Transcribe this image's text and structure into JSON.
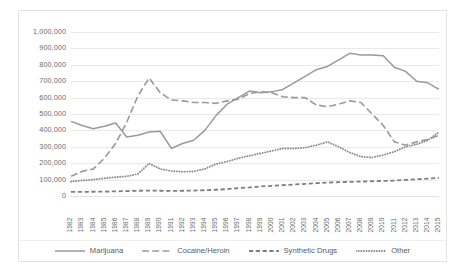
{
  "chart_data": {
    "type": "line",
    "title": "",
    "xlabel": "",
    "ylabel": "",
    "grid": true,
    "legend_position": "bottom",
    "ylim": [
      0,
      1000000
    ],
    "ytick_labels": [
      "1,000,000",
      "900,000",
      "800,000",
      "700,000",
      "600,000",
      "500,000",
      "400,000",
      "300,000",
      "200,000",
      "100,000",
      "0"
    ],
    "yticks": [
      1000000,
      900000,
      800000,
      700000,
      600000,
      500000,
      400000,
      300000,
      200000,
      100000,
      0
    ],
    "categories": [
      "1982",
      "1983",
      "1984",
      "1985",
      "1986",
      "1987",
      "1988",
      "1989",
      "1990",
      "1991",
      "1992",
      "1993",
      "1994",
      "1995",
      "1996",
      "1997",
      "1998",
      "1999",
      "2000",
      "2001",
      "2002",
      "2003",
      "2004",
      "2005",
      "2006",
      "2007",
      "2008",
      "2009",
      "2010",
      "2011",
      "2012",
      "2013",
      "2014",
      "2015"
    ],
    "series": [
      {
        "name": "Marijuana",
        "style": "solid",
        "color": "#9a9a9c",
        "values": [
          455000,
          430000,
          410000,
          425000,
          445000,
          360000,
          370000,
          390000,
          395000,
          290000,
          320000,
          340000,
          400000,
          490000,
          560000,
          600000,
          640000,
          630000,
          635000,
          650000,
          690000,
          730000,
          770000,
          790000,
          830000,
          870000,
          860000,
          860000,
          855000,
          785000,
          760000,
          700000,
          690000,
          650000
        ]
      },
      {
        "name": "Cocaine/Heroin",
        "style": "long-dash",
        "color": "#9a9a9c",
        "values": [
          120000,
          150000,
          165000,
          230000,
          320000,
          450000,
          610000,
          720000,
          630000,
          585000,
          580000,
          570000,
          570000,
          565000,
          580000,
          590000,
          625000,
          635000,
          630000,
          605000,
          600000,
          600000,
          555000,
          545000,
          560000,
          580000,
          570000,
          500000,
          430000,
          330000,
          310000,
          330000,
          345000,
          370000
        ]
      },
      {
        "name": "Synthetic Drugs",
        "style": "dash",
        "color": "#7f7f81",
        "values": [
          25000,
          25000,
          26000,
          27000,
          28000,
          30000,
          32000,
          33000,
          32000,
          31000,
          32000,
          33000,
          35000,
          38000,
          42000,
          48000,
          52000,
          58000,
          62000,
          66000,
          70000,
          74000,
          78000,
          82000,
          84000,
          86000,
          88000,
          90000,
          92000,
          94000,
          98000,
          102000,
          106000,
          110000
        ]
      },
      {
        "name": "Other",
        "style": "dotted",
        "color": "#8a8a8c",
        "values": [
          88000,
          95000,
          100000,
          108000,
          115000,
          120000,
          135000,
          198000,
          165000,
          152000,
          148000,
          150000,
          165000,
          195000,
          210000,
          230000,
          245000,
          260000,
          275000,
          290000,
          290000,
          295000,
          310000,
          330000,
          300000,
          265000,
          240000,
          235000,
          250000,
          270000,
          300000,
          315000,
          340000,
          390000
        ]
      }
    ]
  },
  "legend": {
    "items": [
      {
        "label": "Marijuana",
        "key": "line-key-solid"
      },
      {
        "label": "Cocaine/Heroin",
        "key": "line-key-long-dash"
      },
      {
        "label": "Synthetic Drugs",
        "key": "line-key-dash"
      },
      {
        "label": "Other",
        "key": "line-key-dotted"
      }
    ]
  }
}
